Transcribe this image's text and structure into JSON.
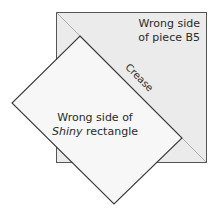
{
  "diagram": {
    "piece_label_line1": "Wrong side",
    "piece_label_line2": "of piece B5",
    "crease_label": "Crease",
    "rect_label_line1": "Wrong side of",
    "rect_label_line2_italic": "Shiny",
    "rect_label_line2_rest": " rectangle",
    "colors": {
      "square_fill": "#ebebeb",
      "rectangle_fill": "#f7f7f7",
      "outline": "#3a3a3a",
      "crease_line": "#9a9a9a"
    }
  }
}
